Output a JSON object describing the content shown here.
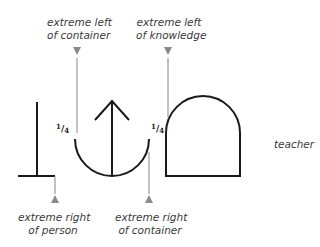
{
  "labels": {
    "top_left_line1": "extreme left",
    "top_left_line2": "of container",
    "top_right_line1": "extreme left",
    "top_right_line2": "of knowledge",
    "bottom_left_line1": "extreme right",
    "bottom_left_line2": "of person",
    "bottom_right_line1": "extreme right",
    "bottom_right_line2": "of container",
    "side_label": "teacher"
  },
  "fractions": {
    "left": {
      "num": "1",
      "den": "4"
    },
    "right": {
      "num": "1",
      "den": "4"
    }
  },
  "symbols": [
    "person-glyph",
    "container-with-arrow-glyph",
    "knowledge-dome-glyph"
  ],
  "colors": {
    "stroke": "#1a1a1a",
    "pointer": "#8a8a8a",
    "text": "#3a3a3a"
  }
}
